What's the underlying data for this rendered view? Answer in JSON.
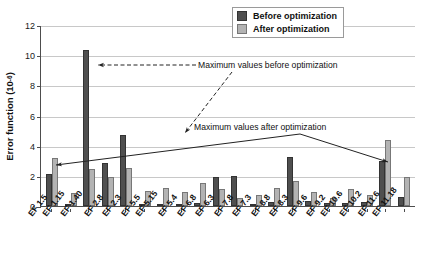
{
  "chart_data": {
    "type": "bar",
    "title": "",
    "xlabel": "",
    "ylabel": "Error function (10-6)",
    "ylabel_base": "Error function (10",
    "ylabel_exp": "-6",
    "ylabel_close": ")",
    "ylim": [
      0,
      12
    ],
    "yticks": [
      0,
      2,
      4,
      6,
      8,
      10,
      12
    ],
    "grid": true,
    "legend_position": "top-right",
    "categories": [
      "EF 1.5",
      "EF 1.15",
      "EF 1.40",
      "EF 2.8",
      "EF 2.3",
      "EF 5.5",
      "EF 5.15",
      "EF 5.4",
      "EF 6.8",
      "EF 6.3",
      "EF 7.8",
      "EF 7.3",
      "EF 8.8",
      "EF 8.3",
      "EF 9.6",
      "EF 9.2",
      "EF 10.6",
      "EF 10.2",
      "EF 11.6",
      "EF 11.18"
    ],
    "series": [
      {
        "name": "Before optimization",
        "color": "#4f4f4f",
        "values": [
          2.1,
          0.05,
          10.35,
          2.85,
          4.7,
          0.1,
          0.1,
          0.15,
          0.2,
          1.95,
          2.0,
          0.15,
          0.25,
          3.25,
          0.35,
          0.2,
          0.2,
          0.25,
          3.0,
          0.6
        ]
      },
      {
        "name": "After optimization",
        "color": "#b3b3b3",
        "values": [
          3.2,
          0.85,
          2.45,
          1.9,
          2.5,
          1.0,
          1.2,
          0.95,
          1.55,
          1.15,
          0.55,
          0.75,
          1.2,
          1.65,
          0.9,
          0.55,
          1.1,
          0.75,
          4.4,
          1.95
        ]
      }
    ],
    "annotations": [
      {
        "id": "annot-before",
        "text": "Maximum values before optimization",
        "style": "dashed-arrow"
      },
      {
        "id": "annot-after",
        "text": "Maximum values after optimization",
        "style": "solid-arrow"
      }
    ]
  },
  "legend": {
    "items": [
      {
        "label": "Before optimization",
        "key": "before"
      },
      {
        "label": "After optimization",
        "key": "after"
      }
    ]
  }
}
